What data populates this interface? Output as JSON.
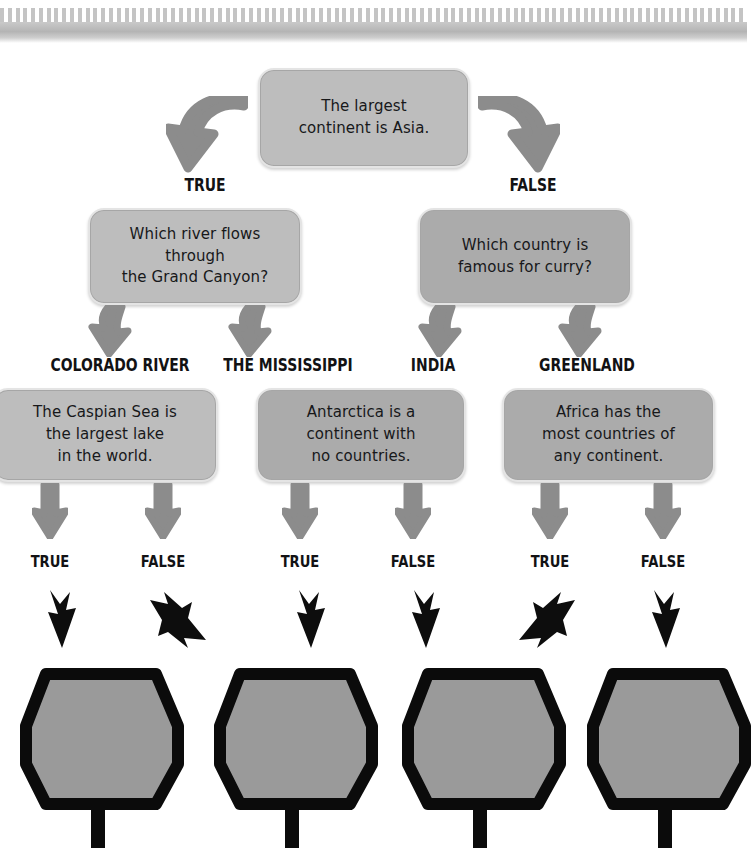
{
  "page": {
    "background_color": "#ffffff",
    "binding_color": "#c4c4c4",
    "card_fill": "#b3b3b3",
    "card_border": "#e4e4e4",
    "arrow_grey": "#8c8c8c",
    "arrow_black": "#0d0d0d",
    "paddle_fill": "#9a9a9a",
    "paddle_outline": "#0b0b0b"
  },
  "binding": {
    "name": "spiral-binding",
    "tooth_count": 96
  },
  "cards": [
    {
      "id": "root-statement",
      "text": "The largest\ncontinent is Asia.",
      "shade": "light"
    },
    {
      "id": "question-true-branch",
      "text": "Which river flows through\nthe Grand Canyon?",
      "shade": "light"
    },
    {
      "id": "question-false-branch",
      "text": "Which country is\nfamous for curry?",
      "shade": "dark"
    },
    {
      "id": "statement-caspian",
      "text": "The Caspian Sea is\nthe largest lake\nin the world.",
      "shade": "light"
    },
    {
      "id": "statement-antarctica",
      "text": "Antarctica is a\ncontinent with\nno countries.",
      "shade": "dark"
    },
    {
      "id": "statement-africa",
      "text": "Africa has the\nmost countries of\nany continent.",
      "shade": "dark"
    }
  ],
  "labels": {
    "row1": [
      {
        "id": "root-true",
        "text": "TRUE"
      },
      {
        "id": "root-false",
        "text": "FALSE"
      }
    ],
    "row2": [
      {
        "id": "answer-colorado-river",
        "text": "COLORADO RIVER"
      },
      {
        "id": "answer-the-mississippi",
        "text": "THE MISSISSIPPI"
      },
      {
        "id": "answer-india",
        "text": "INDIA"
      },
      {
        "id": "answer-greenland",
        "text": "GREENLAND"
      }
    ],
    "row3": [
      {
        "id": "caspian-true",
        "text": "TRUE"
      },
      {
        "id": "caspian-false",
        "text": "FALSE"
      },
      {
        "id": "antarctica-true",
        "text": "TRUE"
      },
      {
        "id": "antarctica-false",
        "text": "FALSE"
      },
      {
        "id": "africa-true",
        "text": "TRUE"
      },
      {
        "id": "africa-false",
        "text": "FALSE"
      }
    ]
  },
  "paddles": [
    {
      "id": "paddle-1"
    },
    {
      "id": "paddle-2"
    },
    {
      "id": "paddle-3"
    },
    {
      "id": "paddle-4"
    }
  ]
}
